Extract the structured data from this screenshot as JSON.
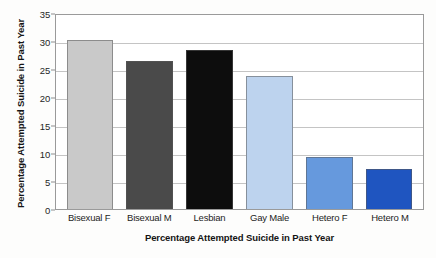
{
  "chart_data": {
    "type": "bar",
    "title": "",
    "xlabel": "Percentage Attempted Suicide in Past Year",
    "ylabel": "Percentage Attempted Suicide in Past Year",
    "categories": [
      "Bisexual F",
      "Bisexual M",
      "Lesbian",
      "Gay Male",
      "Hetero F",
      "Hetero M"
    ],
    "values": [
      30.2,
      26.5,
      28.4,
      23.8,
      9.2,
      7.2
    ],
    "colors": [
      "#c9c9c9",
      "#4a4a4a",
      "#0d0d0d",
      "#bdd3ee",
      "#6699dd",
      "#1f55c0"
    ],
    "ylim": [
      0,
      35
    ],
    "yticks": [
      0,
      5,
      10,
      15,
      20,
      25,
      30,
      35
    ],
    "ytick_labels": [
      "0",
      "5",
      "10",
      "15",
      "20",
      "25",
      "30",
      "35"
    ],
    "grid": true,
    "legend": "none",
    "series": [
      {
        "name": "Percentage Attempted Suicide in Past Year",
        "values": [
          30.2,
          26.5,
          28.4,
          23.8,
          9.2,
          7.2
        ]
      }
    ]
  }
}
